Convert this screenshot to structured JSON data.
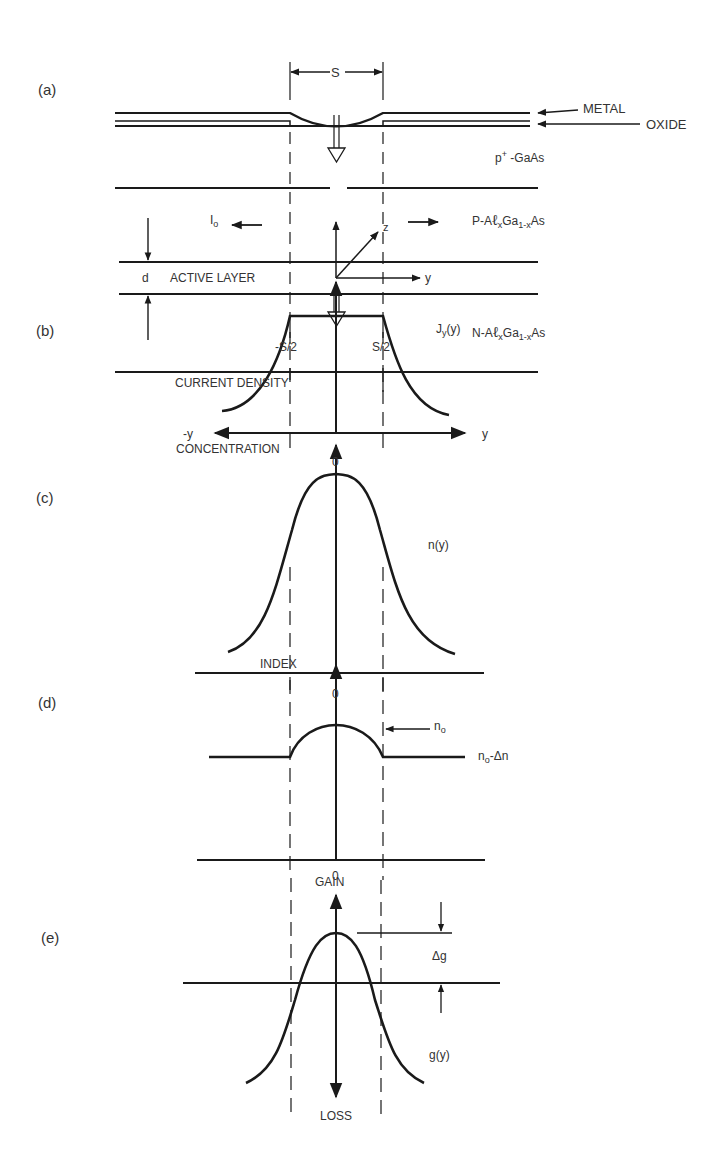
{
  "figure": {
    "panels": [
      {
        "id": "a",
        "tag": "(a)",
        "title": "Device cross-section"
      },
      {
        "id": "b",
        "tag": "(b)",
        "axis_label": "CURRENT DENSITY",
        "curve_label": "J",
        "curve_sub": "y",
        "curve_arg": "(y)",
        "x_neg_label": "-y",
        "x_pos_label": "y",
        "origin_label": "0"
      },
      {
        "id": "c",
        "tag": "(c)",
        "axis_label": "CONCENTRATION",
        "curve_label": "n(y)",
        "origin_label": "0"
      },
      {
        "id": "d",
        "tag": "(d)",
        "axis_label": "INDEX",
        "peak_label": "n",
        "peak_sub": "o",
        "plateau_label": "n",
        "plateau_sub": "o",
        "plateau_suffix": "-Δn",
        "origin_label": "0"
      },
      {
        "id": "e",
        "tag": "(e)",
        "axis_top_label": "GAIN",
        "axis_bottom_label": "LOSS",
        "delta_label": "Δg",
        "curve_label": "g(y)"
      }
    ],
    "layers": {
      "metal": "METAL",
      "oxide": "OXIDE",
      "p_plus": "p",
      "p_plus_sup": "+",
      "p_plus_suffix": "-GaAs",
      "p_algaas_prefix": "P-A",
      "n_algaas_prefix": "N-A",
      "al_glyph": "ℓ",
      "x_sub": "x",
      "ga": "Ga",
      "ga_sub": "1-x",
      "as": "As",
      "active": "ACTIVE LAYER",
      "thickness": "d"
    },
    "dimensions": {
      "stripe_width": "S",
      "left_edge": "-S/2",
      "right_edge": "S/2",
      "current_label": "I",
      "current_sub": "o",
      "center_marker": "I",
      "axis_z": "z",
      "axis_y": "y",
      "axis_x": "x"
    }
  }
}
